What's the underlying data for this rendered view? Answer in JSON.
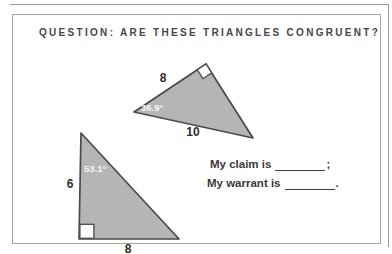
{
  "page": {
    "header": "QUESTION: ARE THESE TRIANGLES CONGRUENT?"
  },
  "figure": {
    "triangle_top": {
      "side_top": "8",
      "side_bottom": "10",
      "angle": "36.9°",
      "right_angle_marker": "top vertex"
    },
    "triangle_bottom": {
      "side_left": "6",
      "side_bottom": "8",
      "angle": "53.1°",
      "right_angle_marker": "bottom-left vertex"
    }
  },
  "prompt": {
    "claim_label": "My claim is",
    "claim_punct": ";",
    "warrant_label": "My warrant is",
    "warrant_punct": "."
  },
  "colors": {
    "triangle_fill": "#b5b5b5",
    "triangle_stroke": "#4a4a4a",
    "header_text": "#46464e",
    "body_text": "#3a3a3a",
    "card_border": "#a5a5a5",
    "angle_text": "#f5f5f5"
  }
}
